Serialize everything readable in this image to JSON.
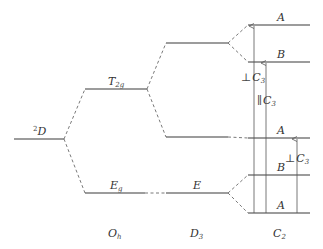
{
  "diagram": {
    "type": "energy-level-splitting",
    "columns": [
      {
        "id": "free-ion",
        "label": ""
      },
      {
        "id": "oh",
        "label": "O",
        "sub": "h"
      },
      {
        "id": "d3",
        "label": "D",
        "sub": "3"
      },
      {
        "id": "c2",
        "label": "C",
        "sub": "2"
      }
    ],
    "free_ion": {
      "sup": "2",
      "label": "D"
    },
    "oh_levels": [
      {
        "label": "T",
        "sub": "2g"
      },
      {
        "label": "E",
        "sub": "g"
      }
    ],
    "d3_levels": [
      {
        "label": ""
      },
      {
        "label": ""
      },
      {
        "label": "E"
      }
    ],
    "c2_levels": [
      {
        "label": "A"
      },
      {
        "label": "B"
      },
      {
        "label": "A"
      },
      {
        "label": "B"
      },
      {
        "label": "A"
      }
    ],
    "transitions": [
      {
        "symbol": "⊥",
        "label": "C",
        "sub": "3",
        "from": "A (bottom)",
        "to": "A (top)"
      },
      {
        "symbol": "∥",
        "label": "C",
        "sub": "3",
        "from": "A (bottom)",
        "to": "B (upper)"
      },
      {
        "symbol": "⊥",
        "label": "C",
        "sub": "3",
        "from": "A (bottom)",
        "to": "A (middle)"
      }
    ]
  }
}
